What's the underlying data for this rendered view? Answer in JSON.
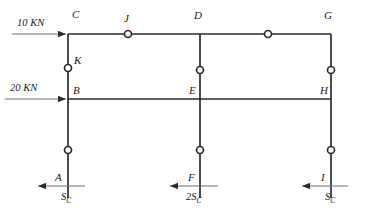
{
  "diagram": {
    "type": "structural-frame",
    "stroke_color": "#2b2b2b",
    "background_color": "#ffffff",
    "nodes": [
      {
        "id": "A",
        "label": "A",
        "x": 68,
        "y": 186,
        "label_x": 55,
        "label_y": 176
      },
      {
        "id": "B",
        "label": "B",
        "x": 68,
        "y": 99,
        "label_x": 73,
        "label_y": 88
      },
      {
        "id": "C",
        "label": "C",
        "x": 68,
        "y": 34,
        "label_x": 72,
        "label_y": 12
      },
      {
        "id": "D",
        "label": "D",
        "x": 200,
        "y": 34,
        "label_x": 194,
        "label_y": 13
      },
      {
        "id": "E",
        "label": "E",
        "x": 200,
        "y": 99,
        "label_x": 191,
        "label_y": 88
      },
      {
        "id": "F",
        "label": "F",
        "x": 200,
        "y": 186,
        "label_x": 188,
        "label_y": 176
      },
      {
        "id": "G",
        "label": "G",
        "x": 331,
        "y": 34,
        "label_x": 325,
        "label_y": 13
      },
      {
        "id": "H",
        "label": "H",
        "x": 331,
        "y": 99,
        "label_x": 322,
        "label_y": 88
      },
      {
        "id": "I",
        "label": "I",
        "x": 331,
        "y": 186,
        "label_x": 320,
        "label_y": 176
      },
      {
        "id": "J",
        "label": "J",
        "x": 128,
        "y": 34,
        "label_x": 125,
        "label_y": 15
      },
      {
        "id": "K",
        "label": "K",
        "x": 68,
        "y": 68,
        "label_x": 74,
        "label_y": 57
      }
    ],
    "members": [
      {
        "name": "beam-top-C-G",
        "x1": 68,
        "y1": 34,
        "x2": 331,
        "y2": 34
      },
      {
        "name": "beam-mid-B-H",
        "x1": 68,
        "y1": 99,
        "x2": 331,
        "y2": 99
      },
      {
        "name": "column-left-C-A",
        "x1": 68,
        "y1": 34,
        "x2": 68,
        "y2": 198
      },
      {
        "name": "column-mid-D-F",
        "x1": 200,
        "y1": 34,
        "x2": 200,
        "y2": 198
      },
      {
        "name": "column-right-G-I",
        "x1": 331,
        "y1": 34,
        "x2": 331,
        "y2": 198
      }
    ],
    "hinges": [
      {
        "name": "hinge-J",
        "x": 128,
        "y": 34,
        "member": "beam-top-C-G"
      },
      {
        "name": "hinge-top-right",
        "x": 268,
        "y": 34,
        "member": "beam-top-C-G"
      },
      {
        "name": "hinge-K",
        "x": 68,
        "y": 68,
        "member": "column-left-C-B"
      },
      {
        "name": "hinge-mid-column-D",
        "x": 200,
        "y": 70,
        "member": "column-mid-D-E"
      },
      {
        "name": "hinge-right-column-G",
        "x": 331,
        "y": 70,
        "member": "column-right-G-H"
      },
      {
        "name": "hinge-lower-left",
        "x": 68,
        "y": 150,
        "member": "column-left-B-A"
      },
      {
        "name": "hinge-lower-mid",
        "x": 200,
        "y": 150,
        "member": "column-mid-E-F"
      },
      {
        "name": "hinge-lower-right",
        "x": 331,
        "y": 150,
        "member": "column-right-H-I"
      }
    ],
    "applied_loads": [
      {
        "name": "load-10kn",
        "label": "10 KN",
        "label_x": 18,
        "label_y": 21,
        "arrow_x1": 12,
        "arrow_y1": 34,
        "arrow_x2": 68,
        "arrow_y2": 34,
        "direction": "right",
        "at_node": "C"
      },
      {
        "name": "load-20kn",
        "label": "20 KN",
        "label_x": 11,
        "label_y": 87,
        "arrow_x1": 5,
        "arrow_y1": 99,
        "arrow_x2": 68,
        "arrow_y2": 99,
        "direction": "right",
        "at_node": "B"
      }
    ],
    "reactions": [
      {
        "name": "reaction-A",
        "symbol": "S",
        "subscript": "C",
        "coefficient": "",
        "label_x": 60,
        "label_y": 200,
        "arrow_x1": 85,
        "arrow_y1": 186,
        "arrow_x2": 36,
        "arrow_y2": 186,
        "direction": "left",
        "at_node": "A"
      },
      {
        "name": "reaction-F",
        "symbol": "S",
        "subscript": "C",
        "coefficient": "2",
        "label_x": 186,
        "label_y": 200,
        "arrow_x1": 218,
        "arrow_y1": 186,
        "arrow_x2": 168,
        "arrow_y2": 186,
        "direction": "left",
        "at_node": "F"
      },
      {
        "name": "reaction-I",
        "symbol": "S",
        "subscript": "C",
        "coefficient": "",
        "label_x": 324,
        "label_y": 200,
        "arrow_x1": 348,
        "arrow_y1": 186,
        "arrow_x2": 300,
        "arrow_y2": 186,
        "direction": "left",
        "at_node": "I"
      }
    ]
  }
}
